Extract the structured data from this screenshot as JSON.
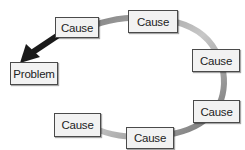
{
  "diagram": {
    "type": "cause-loop",
    "problem": {
      "label": "Problem"
    },
    "causes": [
      {
        "label": "Cause"
      },
      {
        "label": "Cause"
      },
      {
        "label": "Cause"
      },
      {
        "label": "Cause"
      },
      {
        "label": "Cause"
      },
      {
        "label": "Cause"
      }
    ],
    "colors": {
      "loop": "#9a9a9a",
      "arrow": "#1a1a1a",
      "box_fill": "#f2f2f2",
      "box_border": "#4a4a4a"
    }
  }
}
